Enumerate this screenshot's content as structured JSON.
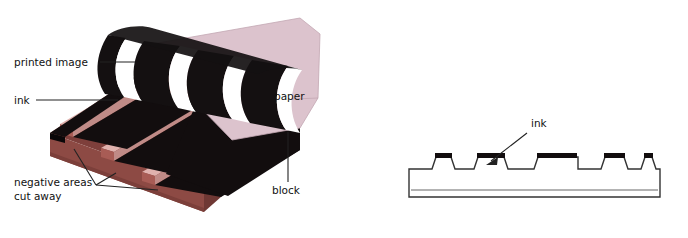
{
  "figure": {
    "panels": [
      "isometric-block",
      "cross-section"
    ]
  },
  "labels": {
    "printed_image": "printed image",
    "ink": "ink",
    "negative_areas_line1": "negative areas",
    "negative_areas_line2": "cut away",
    "paper": "paper",
    "block": "block",
    "ink_section": "ink"
  },
  "colors": {
    "background": "#ffffff",
    "paper": "#dcc3cd",
    "paper_edge": "#c3a7b3",
    "block_front": "#8d4a44",
    "block_side": "#6f3834",
    "block_top": "#7e3f3b",
    "groove_floor": "#d09a97",
    "groove_floor_light": "#e0b2ae",
    "groove_wall": "#a85c55",
    "ink_black": "#120d0e",
    "printed_black": "#141011",
    "unprinted_white": "#ffffff",
    "outline": "#333333",
    "label_text": "#111111"
  },
  "cross_section": {
    "description": "Side profile of inked relief block",
    "base_top_y": 182,
    "base_bottom_y": 197,
    "left_x": 409,
    "right_x": 660,
    "ridge_height": 13,
    "ridges": [
      {
        "left": 432,
        "right": 455,
        "ink": true
      },
      {
        "left": 478,
        "right": 508,
        "ink": true
      },
      {
        "left": 538,
        "right": 578,
        "ink": true
      },
      {
        "left": 605,
        "right": 628,
        "ink": true
      },
      {
        "left": 645,
        "right": 656,
        "ink": true
      }
    ],
    "ink_arrow": {
      "from_x": 527,
      "from_y": 133,
      "to_x": 488,
      "to_y": 163
    }
  },
  "isometric": {
    "description": "Three-dimensional view of carved block with inked raised bands and paper lifting away",
    "ink_bands": 4,
    "cut_grooves": 3,
    "paper_state": "curling up off the block",
    "printed_bands_on_paper": 4
  }
}
